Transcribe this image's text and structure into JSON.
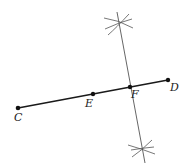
{
  "diagram": {
    "type": "geometric-construction",
    "colors": {
      "line": "#1a1a1a",
      "construction": "#555555",
      "point": "#111111"
    },
    "points": {
      "C": {
        "label": "C",
        "x": 18,
        "y": 108
      },
      "E": {
        "label": "E",
        "x": 93,
        "y": 94
      },
      "F": {
        "label": "F",
        "x": 130,
        "y": 87
      },
      "D": {
        "label": "D",
        "x": 168,
        "y": 80
      }
    },
    "labels": {
      "C": "C",
      "E": "E",
      "F": "F",
      "D": "D"
    }
  }
}
